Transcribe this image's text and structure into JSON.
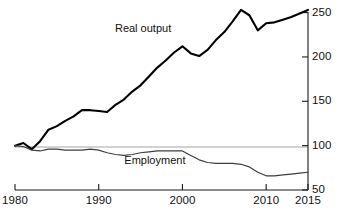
{
  "chart_data": {
    "type": "line",
    "title": "",
    "subtitle": "",
    "xlabel": "",
    "ylabel": "",
    "xlim": [
      1980,
      2015
    ],
    "ylim": [
      50,
      255
    ],
    "xticks": [
      1980,
      1990,
      2000,
      2010,
      2015
    ],
    "xtick_labels": [
      "1980",
      "1990",
      "2000",
      "2010",
      "2015"
    ],
    "yticks": [
      50,
      100,
      150,
      200,
      250
    ],
    "ytick_labels": [
      "50",
      "100",
      "150",
      "200",
      "250"
    ],
    "y_axis_position": "right",
    "grid": "single horizontal reference gridline at 100",
    "gridlines": [
      100
    ],
    "legend": "inline annotations on curves",
    "annotations": [
      {
        "text": "Real output",
        "x": 1996,
        "y": 232
      },
      {
        "text": "Employment",
        "x": 1997,
        "y": 83
      }
    ],
    "series": [
      {
        "name": "Real output",
        "color": "#000000",
        "x": [
          1980,
          1981,
          1982,
          1983,
          1984,
          1985,
          1986,
          1987,
          1988,
          1989,
          1990,
          1991,
          1992,
          1993,
          1994,
          1995,
          1996,
          1997,
          1998,
          1999,
          2000,
          2001,
          2002,
          2003,
          2004,
          2005,
          2006,
          2007,
          2008,
          2009,
          2010,
          2011,
          2012,
          2013,
          2014,
          2015
        ],
        "values": [
          100,
          103,
          96,
          105,
          118,
          122,
          128,
          133,
          140,
          140,
          139,
          138,
          146,
          152,
          161,
          168,
          178,
          188,
          196,
          205,
          212,
          204,
          201,
          208,
          219,
          228,
          240,
          253,
          247,
          230,
          238,
          239,
          242,
          245,
          249,
          253
        ]
      },
      {
        "name": "Employment",
        "color": "#3d3d3d",
        "x": [
          1980,
          1981,
          1982,
          1983,
          1984,
          1985,
          1986,
          1987,
          1988,
          1989,
          1990,
          1991,
          1992,
          1993,
          1994,
          1995,
          1996,
          1997,
          1998,
          1999,
          2000,
          2001,
          2002,
          2003,
          2004,
          2005,
          2006,
          2007,
          2008,
          2009,
          2010,
          2011,
          2012,
          2013,
          2014,
          2015
        ],
        "values": [
          100,
          99,
          95,
          94,
          96,
          96,
          95,
          95,
          95,
          96,
          95,
          92,
          90,
          89,
          90,
          92,
          93,
          94,
          94,
          94,
          94,
          89,
          84,
          81,
          80,
          80,
          80,
          79,
          76,
          70,
          66,
          66,
          67,
          68,
          69,
          70
        ]
      }
    ]
  },
  "axis": {
    "x_ticks": [
      {
        "label": "1980",
        "value": 1980
      },
      {
        "label": "1990",
        "value": 1990
      },
      {
        "label": "2000",
        "value": 2000
      },
      {
        "label": "2010",
        "value": 2010
      },
      {
        "label": "2015",
        "value": 2015
      }
    ],
    "y_ticks": [
      {
        "label": "250",
        "value": 250
      },
      {
        "label": "200",
        "value": 200
      },
      {
        "label": "150",
        "value": 150
      },
      {
        "label": "100",
        "value": 100
      },
      {
        "label": "50",
        "value": 50
      }
    ]
  },
  "labels": {
    "real_output": "Real output",
    "employment": "Employment"
  }
}
